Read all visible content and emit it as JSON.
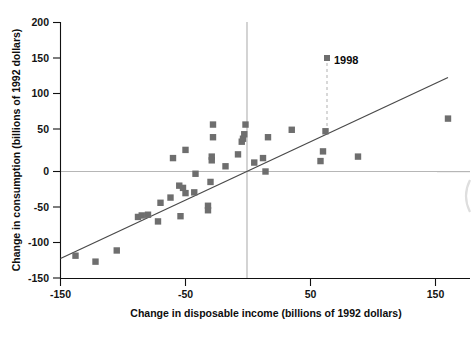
{
  "chart_data": {
    "type": "scatter",
    "title": "",
    "xlabel": "Change in disposable income (billions of 1992 dollars)",
    "ylabel": "Change in consumption (billions of 1992 dollars)",
    "xlim": [
      -150,
      170
    ],
    "ylim": [
      -150,
      200
    ],
    "xticks": [
      -150,
      -50,
      50,
      150
    ],
    "xtick_labels": [
      "-150",
      "-50",
      "50",
      "150"
    ],
    "yticks": [
      -150,
      -100,
      -50,
      0,
      50,
      100,
      150,
      200
    ],
    "ytick_labels": [
      "-150",
      "-100",
      "-50",
      "0",
      "50",
      "100",
      "150",
      "200"
    ],
    "grid": false,
    "legend": "none",
    "reference_lines": [
      {
        "name": "horizontal-zero-line",
        "orientation": "horizontal",
        "value": 0
      },
      {
        "name": "vertical-zero-line",
        "orientation": "vertical",
        "value": 0
      }
    ],
    "fit_line": {
      "name": "regression-line",
      "x_start": -150,
      "y_start": -122,
      "x_end": 165,
      "y_end": 133
    },
    "annotations": [
      {
        "name": "year-1998-callout",
        "label": "1998",
        "marker_x": 62,
        "marker_y": 145,
        "drop_to_y": 54
      }
    ],
    "points": [
      {
        "x": -138,
        "y": -113
      },
      {
        "x": -122,
        "y": -121
      },
      {
        "x": -105,
        "y": -106
      },
      {
        "x": -88,
        "y": -61
      },
      {
        "x": -85,
        "y": -59
      },
      {
        "x": -80,
        "y": -58
      },
      {
        "x": -72,
        "y": -67
      },
      {
        "x": -70,
        "y": -42
      },
      {
        "x": -62,
        "y": -35
      },
      {
        "x": -60,
        "y": 18
      },
      {
        "x": -55,
        "y": -19
      },
      {
        "x": -54,
        "y": -60
      },
      {
        "x": -52,
        "y": -22
      },
      {
        "x": -50,
        "y": -29
      },
      {
        "x": -50,
        "y": 29
      },
      {
        "x": -43,
        "y": -28
      },
      {
        "x": -42,
        "y": -3
      },
      {
        "x": -32,
        "y": -46
      },
      {
        "x": -32,
        "y": -52
      },
      {
        "x": -30,
        "y": -14
      },
      {
        "x": -29,
        "y": 15
      },
      {
        "x": -29,
        "y": 20
      },
      {
        "x": -28,
        "y": 46
      },
      {
        "x": -28,
        "y": 63
      },
      {
        "x": -18,
        "y": 7
      },
      {
        "x": -8,
        "y": 23
      },
      {
        "x": -5,
        "y": 40
      },
      {
        "x": -4,
        "y": 44
      },
      {
        "x": -3,
        "y": 50
      },
      {
        "x": -2,
        "y": 63
      },
      {
        "x": 5,
        "y": 12
      },
      {
        "x": 12,
        "y": 18
      },
      {
        "x": 14,
        "y": 0
      },
      {
        "x": 16,
        "y": 46
      },
      {
        "x": 35,
        "y": 56
      },
      {
        "x": 58,
        "y": 14
      },
      {
        "x": 60,
        "y": 27
      },
      {
        "x": 62,
        "y": 54
      },
      {
        "x": 88,
        "y": 20
      },
      {
        "x": 160,
        "y": 71
      }
    ]
  }
}
